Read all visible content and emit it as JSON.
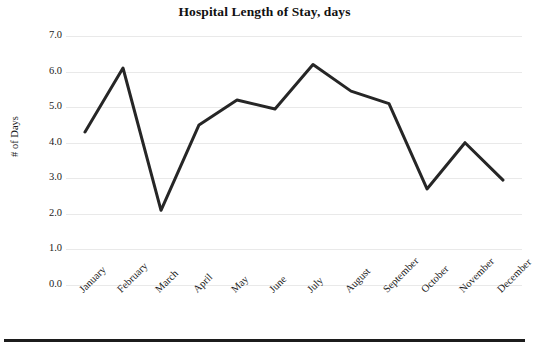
{
  "chart_data": {
    "type": "line",
    "title": "Hospital Length of Stay, days",
    "xlabel": "",
    "ylabel": "# of Days",
    "categories": [
      "January",
      "February",
      "March",
      "April",
      "May",
      "June",
      "July",
      "August",
      "September",
      "October",
      "November",
      "December"
    ],
    "values": [
      4.3,
      6.1,
      2.1,
      4.5,
      5.2,
      4.95,
      6.2,
      5.45,
      5.1,
      2.7,
      4.0,
      2.95
    ],
    "series": [
      {
        "name": "Length of Stay",
        "values": [
          4.3,
          6.1,
          2.1,
          4.5,
          5.2,
          4.95,
          6.2,
          5.45,
          5.1,
          2.7,
          4.0,
          2.95
        ]
      }
    ],
    "ylim": [
      0.0,
      7.0
    ],
    "y_ticks": [
      7.0,
      6.0,
      5.0,
      4.0,
      3.0,
      2.0,
      1.0,
      0.0
    ],
    "y_tick_labels": [
      "7.0",
      "6.0",
      "5.0",
      "4.0",
      "3.0",
      "2.0",
      "1.0",
      "0.0"
    ],
    "grid": true,
    "grid_axis": "y",
    "legend": false,
    "legend_position": "none",
    "line_color": "#262626",
    "line_width": 3,
    "markers": false,
    "background_color": "#ffffff",
    "gridline_color": "#e9e9e9",
    "x_tick_rotation": -45
  },
  "figure": {
    "bottom_rule_color": "#1c1c1c"
  }
}
